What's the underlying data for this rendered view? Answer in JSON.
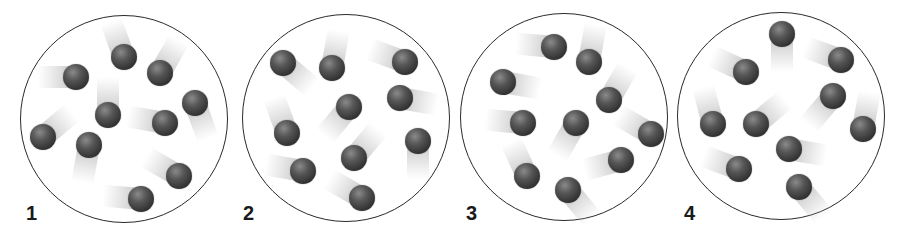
{
  "figure": {
    "colors": {
      "outline": "#2a2a2a",
      "particle": "#3a3a3a",
      "trail": "#b4b4b4",
      "background": "#ffffff"
    },
    "particle_radius": 13,
    "containers": [
      {
        "label": "1",
        "center": [
          124,
          119
        ],
        "radius": 104,
        "label_pos": [
          26,
          203
        ],
        "particles": [
          {
            "x": 76,
            "y": 77,
            "trail_angle": 180
          },
          {
            "x": 124,
            "y": 57,
            "trail_angle": 250
          },
          {
            "x": 160,
            "y": 73,
            "trail_angle": 300
          },
          {
            "x": 195,
            "y": 103,
            "trail_angle": 70
          },
          {
            "x": 108,
            "y": 115,
            "trail_angle": 270
          },
          {
            "x": 165,
            "y": 123,
            "trail_angle": 190
          },
          {
            "x": 43,
            "y": 137,
            "trail_angle": 320
          },
          {
            "x": 89,
            "y": 145,
            "trail_angle": 100
          },
          {
            "x": 179,
            "y": 176,
            "trail_angle": 210
          },
          {
            "x": 141,
            "y": 199,
            "trail_angle": 185
          }
        ]
      },
      {
        "label": "2",
        "center": [
          346,
          118
        ],
        "radius": 104,
        "label_pos": [
          243,
          203
        ],
        "particles": [
          {
            "x": 283,
            "y": 63,
            "trail_angle": 40
          },
          {
            "x": 332,
            "y": 68,
            "trail_angle": 280
          },
          {
            "x": 405,
            "y": 62,
            "trail_angle": 200
          },
          {
            "x": 400,
            "y": 98,
            "trail_angle": 10
          },
          {
            "x": 349,
            "y": 107,
            "trail_angle": 130
          },
          {
            "x": 287,
            "y": 133,
            "trail_angle": 250
          },
          {
            "x": 418,
            "y": 141,
            "trail_angle": 90
          },
          {
            "x": 354,
            "y": 158,
            "trail_angle": 310
          },
          {
            "x": 303,
            "y": 171,
            "trail_angle": 190
          },
          {
            "x": 362,
            "y": 198,
            "trail_angle": 210
          }
        ]
      },
      {
        "label": "3",
        "center": [
          564,
          117
        ],
        "radius": 104,
        "label_pos": [
          466,
          203
        ],
        "particles": [
          {
            "x": 554,
            "y": 47,
            "trail_angle": 185
          },
          {
            "x": 589,
            "y": 62,
            "trail_angle": 280
          },
          {
            "x": 503,
            "y": 82,
            "trail_angle": 10
          },
          {
            "x": 609,
            "y": 100,
            "trail_angle": 300
          },
          {
            "x": 523,
            "y": 123,
            "trail_angle": 185
          },
          {
            "x": 576,
            "y": 123,
            "trail_angle": 120
          },
          {
            "x": 651,
            "y": 134,
            "trail_angle": 210
          },
          {
            "x": 621,
            "y": 160,
            "trail_angle": 165
          },
          {
            "x": 527,
            "y": 176,
            "trail_angle": 245
          },
          {
            "x": 568,
            "y": 190,
            "trail_angle": 50
          }
        ]
      },
      {
        "label": "4",
        "center": [
          781,
          116
        ],
        "radius": 104,
        "label_pos": [
          684,
          203
        ],
        "particles": [
          {
            "x": 782,
            "y": 34,
            "trail_angle": 90
          },
          {
            "x": 841,
            "y": 60,
            "trail_angle": 200
          },
          {
            "x": 746,
            "y": 72,
            "trail_angle": 205
          },
          {
            "x": 833,
            "y": 96,
            "trail_angle": 130
          },
          {
            "x": 713,
            "y": 124,
            "trail_angle": 255
          },
          {
            "x": 756,
            "y": 124,
            "trail_angle": 320
          },
          {
            "x": 863,
            "y": 129,
            "trail_angle": 280
          },
          {
            "x": 789,
            "y": 149,
            "trail_angle": 10
          },
          {
            "x": 739,
            "y": 169,
            "trail_angle": 200
          },
          {
            "x": 799,
            "y": 187,
            "trail_angle": 50
          }
        ]
      }
    ]
  }
}
